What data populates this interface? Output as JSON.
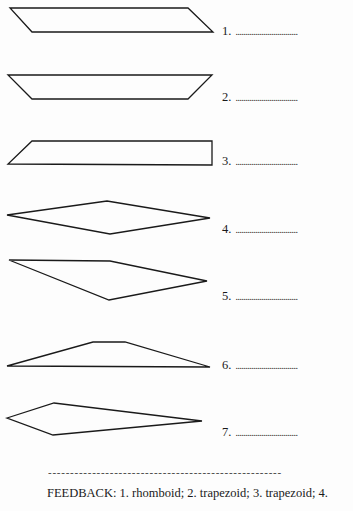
{
  "exercise": {
    "items": [
      {
        "number": "1.",
        "blank": "...............................",
        "shape": "rhomboid-shape",
        "points": "10,8 188,8 213,32 32,32",
        "label_top": 24
      },
      {
        "number": "2.",
        "blank": "...............................",
        "shape": "trapezoid-shape",
        "points": "8,75 212,75 188,99 32,99",
        "label_top": 90
      },
      {
        "number": "3.",
        "blank": "...............................",
        "shape": "trapezoid-right-shape",
        "points": "32,141 212,141 212,165 8,164",
        "label_top": 154
      },
      {
        "number": "4.",
        "blank": "...............................",
        "shape": "rhombus-shape",
        "points": "7,215 107,201 210,218 110,234",
        "label_top": 222
      },
      {
        "number": "5.",
        "blank": "...............................",
        "shape": "kite-shape",
        "points": "9,260 110,261 207,281 109,300",
        "label_top": 289
      },
      {
        "number": "6.",
        "blank": "...............................",
        "shape": "flat-trapezoid-shape",
        "points": "7,366 93,342 125,342 210,367",
        "label_top": 358
      },
      {
        "number": "7.",
        "blank": "...............................",
        "shape": "dart-shape",
        "points": "7,418 54,403 202,421 53,435",
        "label_top": 425
      }
    ]
  },
  "separator": "- - - - - - - - - - - - - - - - - - - - - - - - - - - - - - - - - - - - - - - - - - - - - - - - - - - - -",
  "feedback": "FEEDBACK: 1. rhomboid; 2. trapezoid; 3. trapezoid; 4."
}
